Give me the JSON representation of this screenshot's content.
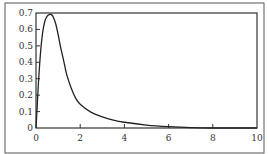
{
  "chart_data": {
    "type": "line",
    "title": "",
    "xlabel": "",
    "ylabel": "",
    "xlim": [
      0,
      10
    ],
    "ylim": [
      0,
      0.7
    ],
    "grid": false,
    "legend": null,
    "x_ticks": [
      "0",
      "2",
      "4",
      "6",
      "8",
      "10"
    ],
    "y_ticks": [
      "0",
      "0.1",
      "0.2",
      "0.3",
      "0.4",
      "0.5",
      "0.6",
      "0.7"
    ],
    "series": [
      {
        "name": "density",
        "color": "#222222",
        "x": [
          0,
          0.05,
          0.1,
          0.2,
          0.3,
          0.4,
          0.5,
          0.6,
          0.7,
          0.8,
          0.9,
          1.0,
          1.1,
          1.2,
          1.3,
          1.4,
          1.6,
          1.8,
          2.0,
          2.5,
          3.0,
          3.5,
          4.0,
          5.0,
          6.0,
          7.0,
          8.0,
          10.0
        ],
        "y": [
          0,
          0.12,
          0.25,
          0.45,
          0.58,
          0.65,
          0.68,
          0.69,
          0.69,
          0.67,
          0.63,
          0.57,
          0.5,
          0.44,
          0.38,
          0.32,
          0.24,
          0.18,
          0.145,
          0.095,
          0.068,
          0.048,
          0.035,
          0.018,
          0.008,
          0.002,
          0.0,
          0.0
        ]
      }
    ]
  }
}
